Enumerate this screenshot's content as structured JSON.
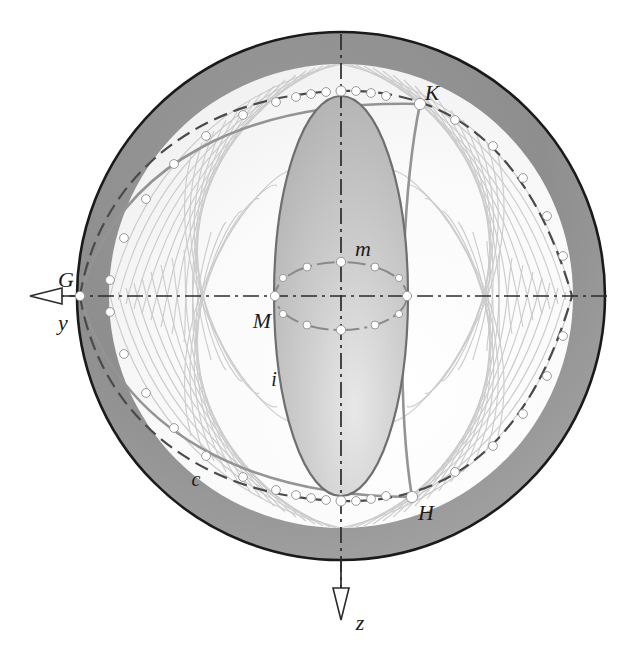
{
  "figure": {
    "type": "geometric-diagram"
  },
  "colors": {
    "outline": "#1a1a1a",
    "outer_band": "#8c8c8c",
    "inner_fill_light": "#fbfbfb",
    "inner_ellipse_fill": "#bdbdbd",
    "mesh_curve": "#c9c9c9",
    "bold_curve": "#8f8f8f",
    "axis": "#262626",
    "node_dot": "#ffffff",
    "label": "#1c1c1c",
    "background": "#ffffff"
  },
  "sphere": {
    "center_x": 341,
    "center_y": 296,
    "radius": 265,
    "band_inner_radius": 232
  },
  "axes": [
    {
      "name": "y-axis",
      "label": "y",
      "label_x": 63,
      "label_y": 325,
      "direction": "left",
      "arrow_tip_x": 30,
      "arrow_y": 296
    },
    {
      "name": "z-axis",
      "label": "z",
      "label_x": 356,
      "label_y": 628,
      "direction": "down",
      "arrow_tip_y": 620,
      "arrow_x": 341
    }
  ],
  "points": [
    {
      "id": "G",
      "label": "G",
      "x": 80,
      "y": 296,
      "label_x": 66,
      "label_y": 287
    },
    {
      "id": "K",
      "label": "K",
      "x": 420,
      "y": 104,
      "label_x": 428,
      "label_y": 98
    },
    {
      "id": "H",
      "label": "H",
      "x": 412,
      "y": 497,
      "label_x": 420,
      "label_y": 516
    },
    {
      "id": "M",
      "label": "M",
      "x": 275,
      "y": 296,
      "label_x": 257,
      "label_y": 325
    },
    {
      "id": "m",
      "label": "m",
      "x": 341,
      "y": 262,
      "label_x": 358,
      "label_y": 255
    }
  ],
  "curve_labels": [
    {
      "id": "c",
      "label": "c",
      "x": 196,
      "y": 482,
      "description": "lower dashed great circle arc"
    },
    {
      "id": "i",
      "label": "i",
      "x": 274,
      "y": 382,
      "description": "inner vertical ellipse"
    }
  ],
  "elements": {
    "outer_circle": "sphere silhouette with dark outline and grey shaded annulus",
    "inner_vertical_ellipse": "shaded meridian ellipse through poles",
    "central_small_ellipse": "dash-dot equatorial ellipse through M and m",
    "upper_arc": "dashed arc carrying node dots, passes through K",
    "lower_arc": "dashed arc carrying node dots, passes through H",
    "mesh": "family of light grey great-circle curves forming a lattice",
    "bold_arcs": "two heavier grey arcs from G to K and G to H"
  },
  "mesh": {
    "count_left_family": 16,
    "count_right_family": 16,
    "node_dot_radius": 4.5
  }
}
